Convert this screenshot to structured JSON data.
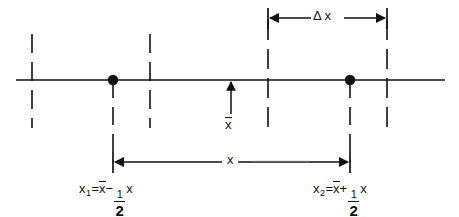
{
  "figure": {
    "name": "number-line-interval-diagram",
    "background_color": "#ffffff",
    "stroke_color": "#111111",
    "artifact_color": "#c06070"
  },
  "axis": {
    "name": "horizontal-number-line",
    "y": 80,
    "x_start": 16,
    "x_end": 445
  },
  "points": [
    {
      "id": "x1",
      "x": 113,
      "y": 80,
      "label_key": "labels.x1"
    },
    {
      "id": "x2",
      "x": 350,
      "y": 80,
      "label_key": "labels.x2"
    }
  ],
  "dashed_lines": [
    {
      "name": "dashed-far-left",
      "x": 32,
      "y_top": 34,
      "y_bottom": 128
    },
    {
      "name": "dashed-x1-drop",
      "x": 113,
      "y_top": 80,
      "y_bottom": 162
    },
    {
      "name": "dashed-left-inner",
      "x": 150,
      "y_top": 34,
      "y_bottom": 128
    },
    {
      "name": "dashed-right-inner",
      "x": 268,
      "y_top": 20,
      "y_bottom": 128
    },
    {
      "name": "dashed-x2-drop",
      "x": 350,
      "y_top": 80,
      "y_bottom": 162
    },
    {
      "name": "dashed-far-right",
      "x": 387,
      "y_top": 20,
      "y_bottom": 128
    }
  ],
  "dimensions": {
    "delta_x": {
      "name": "delta-x-dimension",
      "y": 18,
      "x_start": 268,
      "x_end": 387,
      "arrow_direction": "inward",
      "label": "Δ x"
    },
    "x_total": {
      "name": "x-dimension",
      "y": 162,
      "x_start": 113,
      "x_end": 350,
      "arrow_direction": "outward",
      "label": "x"
    }
  },
  "mean_marker": {
    "name": "x-bar-arrow",
    "x": 231,
    "y_tip": 80,
    "y_tail": 120,
    "label": "x̄"
  },
  "labels": {
    "delta_x": "Δ x",
    "x_dim": "x",
    "x_bar": "x",
    "x1": {
      "var": "x",
      "subscript": "1",
      "equals": "=",
      "mean": "x",
      "operator": "−",
      "numerator": "1",
      "denominator": "2",
      "trailing": "x",
      "plain": "x₁ = x̄ − ½ x"
    },
    "x2": {
      "var": "x",
      "subscript": "2",
      "equals": "=",
      "mean": "x",
      "operator": "+",
      "numerator": "1",
      "denominator": "2",
      "trailing": "x",
      "plain": "x₂ = x̄ + ½ x"
    }
  }
}
